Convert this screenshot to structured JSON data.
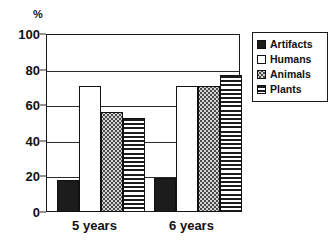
{
  "chart_data": {
    "type": "bar",
    "title": "",
    "xlabel": "",
    "ylabel": "%",
    "ylim": [
      0,
      100
    ],
    "yticks": [
      0,
      20,
      40,
      60,
      80,
      100
    ],
    "grid": true,
    "legend_position": "upper right (outside plot)",
    "categories": [
      "5 years",
      "6 years"
    ],
    "series": [
      {
        "name": "Artifacts",
        "fill": "solid-black",
        "values": [
          18,
          19
        ]
      },
      {
        "name": "Humans",
        "fill": "white-empty",
        "values": [
          71,
          71
        ]
      },
      {
        "name": "Animals",
        "fill": "gray-dotted",
        "values": [
          56,
          71
        ]
      },
      {
        "name": "Plants",
        "fill": "horizontal-lines",
        "values": [
          53,
          77
        ]
      }
    ]
  },
  "colors": {
    "axis": "#1a1a1a",
    "solid": "#1c1c1c",
    "empty": "#ffffff",
    "dots": "#d5d5d5",
    "lines": "#1c1c1c",
    "background": "#ffffff"
  }
}
